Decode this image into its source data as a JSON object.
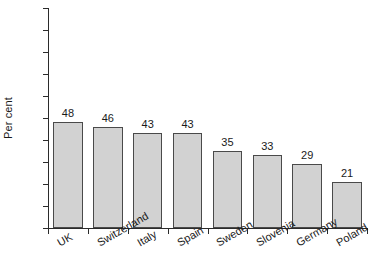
{
  "chart_data": {
    "type": "bar",
    "title": "",
    "subtitle": "",
    "xlabel": "",
    "ylabel": "Per cent",
    "ylim": [
      0,
      100
    ],
    "ytick_step": 10,
    "grid": false,
    "legend": null,
    "bar_fill_color": "#d2d2d2",
    "bar_edge_color": "#4a4a4a",
    "axis_color": "#2b2b2b",
    "text_color": "#1a1a1a",
    "categories": [
      "UK",
      "Switzerland",
      "Italy",
      "Spain",
      "Sweden",
      "Slovenia",
      "Germany",
      "Poland"
    ],
    "values": [
      48,
      46,
      43,
      43,
      35,
      33,
      29,
      21
    ],
    "data_labels": [
      "48",
      "46",
      "43",
      "43",
      "35",
      "33",
      "29",
      "21"
    ],
    "ytick_labels": [
      "100",
      "90",
      "80",
      "70",
      "60",
      "50",
      "40",
      "30",
      "20",
      "10",
      "0"
    ],
    "ytick_values": [
      100,
      90,
      80,
      70,
      60,
      50,
      40,
      30,
      20,
      10,
      0
    ]
  }
}
